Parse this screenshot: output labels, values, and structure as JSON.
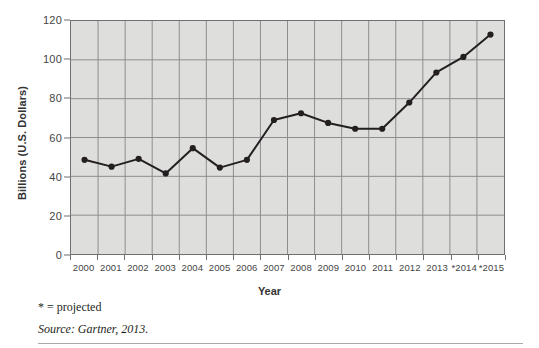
{
  "chart_data": {
    "type": "line",
    "title": "",
    "xlabel": "Year",
    "ylabel": "Billions (U.S. Dollars)",
    "categories": [
      "2000",
      "2001",
      "2002",
      "2003",
      "2004",
      "2005",
      "2006",
      "2007",
      "2008",
      "2009",
      "2010",
      "2011",
      "2012",
      "2013",
      "*2014",
      "*2015"
    ],
    "values": [
      48.5,
      45.0,
      49.0,
      41.5,
      54.5,
      44.5,
      48.5,
      69.0,
      72.5,
      67.5,
      64.5,
      64.5,
      78.0,
      93.5,
      101.5,
      113.0
    ],
    "series": [
      {
        "name": "Billions (U.S. Dollars)",
        "values": [
          48.5,
          45.0,
          49.0,
          41.5,
          54.5,
          44.5,
          48.5,
          69.0,
          72.5,
          67.5,
          64.5,
          64.5,
          78.0,
          93.5,
          101.5,
          113.0
        ]
      }
    ],
    "ylim": [
      0,
      120
    ],
    "yticks": [
      0,
      20,
      40,
      60,
      80,
      100,
      120
    ],
    "ytick_labels": [
      "0",
      "20",
      "40",
      "60",
      "80",
      "100",
      "120"
    ],
    "xtick_labels": [
      "2000",
      "2001",
      "2002",
      "2003",
      "2004",
      "2005",
      "2006",
      "2007",
      "2008",
      "2009",
      "2010",
      "2011",
      "2012",
      "2013",
      "*2014",
      "*2015"
    ],
    "grid": true,
    "grid_axis": "both",
    "legend": "none",
    "annotations": [
      "* = projected",
      "Source: Gartner, 2013."
    ],
    "colors": {
      "plot_background": "#dededd",
      "grid": "#8d8d8d",
      "axis": "#6f6f6f",
      "line": "#231f20",
      "marker": "#231f20",
      "text": "#454545"
    }
  },
  "footnotes": {
    "projected": "* = projected",
    "source": "Source: Gartner, 2013."
  },
  "axis_titles": {
    "x": "Year",
    "y": "Billions (U.S. Dollars)"
  }
}
